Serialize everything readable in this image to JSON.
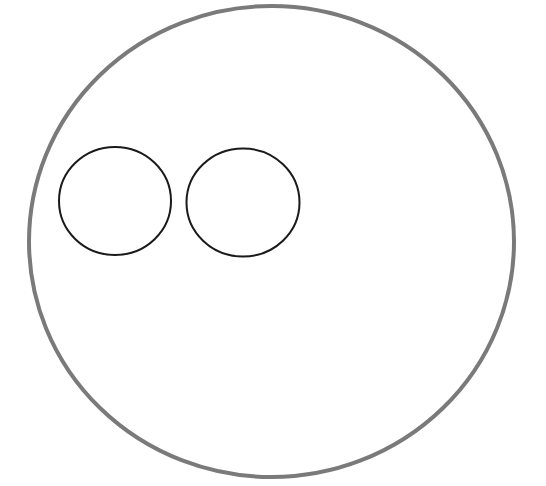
{
  "canvas": {
    "width": 546,
    "height": 486,
    "background_color": "#ffffff",
    "title": "Two small circles inside one large circle"
  },
  "palette": {
    "outer_stroke": "#7a7a7a",
    "inner_stroke": "#1a1a1a",
    "fill": "none",
    "background": "#ffffff"
  },
  "chart_data": {
    "type": "diagram",
    "xlabel": "",
    "ylabel": "",
    "grid": false,
    "legend": false,
    "xlim": [
      0,
      546
    ],
    "ylim": [
      0,
      486
    ],
    "shapes": [
      {
        "id": "outer-circle",
        "name": "large-circle",
        "kind": "ellipse",
        "cx": 271.5,
        "cy": 241.5,
        "rx": 242.5,
        "ry": 235.5,
        "stroke": "#7a7a7a",
        "stroke_width": 4,
        "fill": "none"
      },
      {
        "id": "inner-circle-left",
        "name": "small-circle-left",
        "kind": "ellipse",
        "cx": 115,
        "cy": 201,
        "rx": 56,
        "ry": 54,
        "stroke": "#1a1a1a",
        "stroke_width": 2,
        "fill": "none"
      },
      {
        "id": "inner-circle-right",
        "name": "small-circle-right",
        "kind": "ellipse",
        "cx": 243,
        "cy": 202.5,
        "rx": 56.5,
        "ry": 54,
        "stroke": "#1a1a1a",
        "stroke_width": 2,
        "fill": "none"
      }
    ],
    "counts": {
      "total_circles": 3,
      "large_circles": 1,
      "small_circles": 2
    },
    "annotations": [],
    "tick_labels": {
      "x": [],
      "y": []
    }
  }
}
